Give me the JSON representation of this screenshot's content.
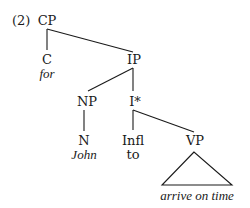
{
  "example_number": "(2)",
  "tree": {
    "root": {
      "label": "CP"
    },
    "c_node": {
      "label": "C",
      "word": "for"
    },
    "ip_node": {
      "label": "IP"
    },
    "np_node": {
      "label": "NP"
    },
    "ibar_node": {
      "label": "I*"
    },
    "n_node": {
      "label": "N",
      "word": "John"
    },
    "infl_node": {
      "label": "Infl",
      "word": "to"
    },
    "vp_node": {
      "label": "VP",
      "phrase": "arrive on time"
    }
  },
  "colors": {
    "ink": "#1a1a1a",
    "background": "#ffffff"
  }
}
